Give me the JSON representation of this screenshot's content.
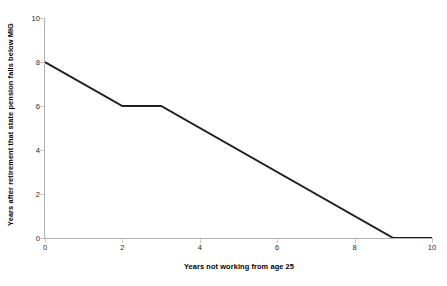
{
  "chart_data": {
    "type": "line",
    "title": "",
    "xlabel": "Years not working from age 25",
    "ylabel": "Years after retirement that state pension falls below MIG",
    "xlim": [
      0,
      10
    ],
    "ylim": [
      0,
      10
    ],
    "xticks": [
      0,
      2,
      4,
      6,
      8,
      10
    ],
    "yticks": [
      0,
      2,
      4,
      6,
      8,
      10
    ],
    "xtick_labels": [
      "0",
      "2",
      "4",
      "6",
      "8",
      "10"
    ],
    "ytick_labels": [
      "0",
      "2",
      "4",
      "6",
      "8",
      "10"
    ],
    "grid": false,
    "legend": false,
    "series": [
      {
        "name": "Years below MIG",
        "color": "#231f20",
        "line_width": 2,
        "x": [
          0,
          2,
          3,
          9,
          10
        ],
        "values": [
          8,
          6,
          6,
          0,
          0
        ],
        "points": [
          {
            "x": 0,
            "y": 8
          },
          {
            "x": 2,
            "y": 6
          },
          {
            "x": 3,
            "y": 6
          },
          {
            "x": 9,
            "y": 0
          },
          {
            "x": 10,
            "y": 0
          }
        ]
      }
    ],
    "axis_color": "#b0b0b0",
    "tick_color": "#c8c8c8",
    "background": "#ffffff"
  }
}
